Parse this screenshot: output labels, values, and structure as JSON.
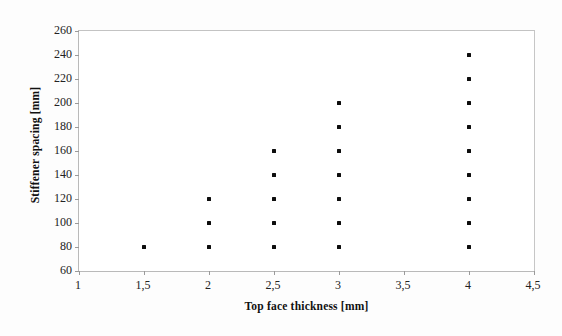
{
  "chart_data": {
    "type": "scatter",
    "title": "",
    "xlabel": "Top face thickness [mm]",
    "ylabel": "Stiffener spacing [mm]",
    "xlim": [
      1,
      4.5
    ],
    "ylim": [
      60,
      260
    ],
    "xticks": [
      1,
      1.5,
      2,
      2.5,
      3,
      3.5,
      4,
      4.5
    ],
    "xtick_labels": [
      "1",
      "1,5",
      "2",
      "2,5",
      "3",
      "3,5",
      "4",
      "4,5"
    ],
    "yticks": [
      60,
      80,
      100,
      120,
      140,
      160,
      180,
      200,
      220,
      240,
      260
    ],
    "ytick_labels": [
      "60",
      "80",
      "100",
      "120",
      "140",
      "160",
      "180",
      "200",
      "220",
      "240",
      "260"
    ],
    "grid": false,
    "legend": false,
    "marker": "square",
    "marker_color": "#0d0d0d",
    "series": [
      {
        "name": "design points",
        "points": [
          {
            "x": 1.5,
            "y": 80
          },
          {
            "x": 2,
            "y": 80
          },
          {
            "x": 2,
            "y": 100
          },
          {
            "x": 2,
            "y": 120
          },
          {
            "x": 2.5,
            "y": 80
          },
          {
            "x": 2.5,
            "y": 100
          },
          {
            "x": 2.5,
            "y": 120
          },
          {
            "x": 2.5,
            "y": 140
          },
          {
            "x": 2.5,
            "y": 160
          },
          {
            "x": 3,
            "y": 80
          },
          {
            "x": 3,
            "y": 100
          },
          {
            "x": 3,
            "y": 120
          },
          {
            "x": 3,
            "y": 140
          },
          {
            "x": 3,
            "y": 160
          },
          {
            "x": 3,
            "y": 180
          },
          {
            "x": 3,
            "y": 200
          },
          {
            "x": 4,
            "y": 80
          },
          {
            "x": 4,
            "y": 100
          },
          {
            "x": 4,
            "y": 120
          },
          {
            "x": 4,
            "y": 140
          },
          {
            "x": 4,
            "y": 160
          },
          {
            "x": 4,
            "y": 180
          },
          {
            "x": 4,
            "y": 200
          },
          {
            "x": 4,
            "y": 220
          },
          {
            "x": 4,
            "y": 240
          }
        ]
      }
    ]
  }
}
